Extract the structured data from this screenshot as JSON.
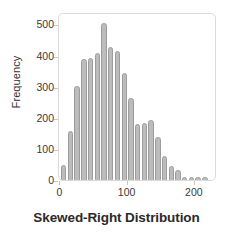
{
  "chart_data": {
    "type": "bar",
    "title": "Skewed-Right Distribution",
    "xlabel": "",
    "ylabel": "Frequency",
    "xlim": [
      -2,
      233
    ],
    "ylim": [
      0,
      540
    ],
    "grid": false,
    "legend": null,
    "bin_width": 10,
    "x_ticks": [
      0,
      100,
      200
    ],
    "x_tick_labels": [
      "0",
      "100",
      "200"
    ],
    "y_ticks": [
      0,
      100,
      200,
      300,
      400,
      500
    ],
    "y_tick_labels": [
      "0",
      "100",
      "200",
      "300",
      "400",
      "500"
    ],
    "bar_color": "#bcbcbc",
    "bar_edge_color": "#9c9c9c",
    "categories": [
      5,
      15,
      25,
      35,
      45,
      55,
      65,
      75,
      85,
      95,
      105,
      115,
      125,
      135,
      145,
      155,
      165,
      175,
      185,
      195,
      205,
      215
    ],
    "values": [
      55,
      165,
      310,
      395,
      400,
      415,
      510,
      435,
      420,
      350,
      270,
      185,
      190,
      200,
      145,
      85,
      50,
      40,
      15,
      12,
      12,
      12
    ]
  },
  "axes": {
    "y_title": "Frequency"
  },
  "figure": {
    "title": "Skewed-Right Distribution"
  }
}
